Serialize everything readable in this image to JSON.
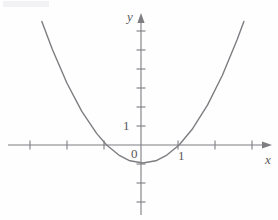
{
  "figure": {
    "name": "parabola-coordinate-graph",
    "background_color": "#fefefe",
    "stroke_color": "#7d7d82",
    "text_color": "#58585a",
    "width": 278,
    "height": 220
  },
  "labels": {
    "y_axis": "y",
    "x_axis": "x",
    "origin": "0",
    "x_tick_one": "1",
    "y_tick_one": "1"
  },
  "chart_data": {
    "type": "line",
    "title": "",
    "xlabel": "x",
    "ylabel": "y",
    "curve_label": "parabola",
    "grid": false,
    "legend": false,
    "axes": {
      "origin_px": [
        141,
        145
      ],
      "x_unit_px": 37,
      "y_unit_px": 19,
      "xlim": [
        -3.8,
        3.4
      ],
      "ylim": [
        -4.2,
        6.8
      ],
      "x_ticks": [
        -3,
        -2,
        -1,
        1,
        2,
        3
      ],
      "x_tick_labels": [
        "",
        "",
        "",
        "1",
        "",
        ""
      ],
      "y_ticks": [
        -4,
        -3,
        -2,
        -1,
        1,
        2,
        3,
        4,
        5,
        6
      ],
      "y_tick_labels": [
        "",
        "",
        "",
        "",
        "1",
        "",
        "",
        "",
        "",
        ""
      ],
      "arrow_x_positive": true,
      "arrow_y_positive": true
    },
    "function": "y = x^2 - 0.1x - 0.95",
    "coefficients": {
      "a": 1,
      "b": -0.1,
      "c": -0.95
    },
    "vertex": [
      0.05,
      -0.95
    ],
    "roots": [
      -0.93,
      1.03
    ],
    "y_intercept": -0.95,
    "x_domain_drawn": [
      -2.68,
      2.78
    ],
    "points": [
      {
        "x": -2.68,
        "y": 6.5
      },
      {
        "x": -2.4,
        "y": 5.05
      },
      {
        "x": -2.0,
        "y": 3.25
      },
      {
        "x": -1.6,
        "y": 1.77
      },
      {
        "x": -1.2,
        "y": 0.61
      },
      {
        "x": -0.93,
        "y": 0.0
      },
      {
        "x": -0.6,
        "y": -0.53
      },
      {
        "x": -0.3,
        "y": -0.83
      },
      {
        "x": 0.05,
        "y": -0.95
      },
      {
        "x": 0.4,
        "y": -0.83
      },
      {
        "x": 0.7,
        "y": -0.53
      },
      {
        "x": 1.03,
        "y": 0.0
      },
      {
        "x": 1.4,
        "y": 0.87
      },
      {
        "x": 1.8,
        "y": 2.11
      },
      {
        "x": 2.2,
        "y": 3.67
      },
      {
        "x": 2.6,
        "y": 5.55
      },
      {
        "x": 2.78,
        "y": 6.5
      }
    ]
  }
}
